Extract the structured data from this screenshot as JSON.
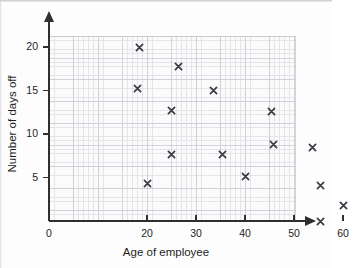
{
  "chart_data": {
    "type": "scatter",
    "title": "",
    "xlabel": "Age of employee",
    "ylabel": "Number of days off",
    "xlim": [
      0,
      63
    ],
    "ylim": [
      0,
      21.5
    ],
    "xticks": [
      0,
      20,
      30,
      40,
      50,
      60
    ],
    "xtick_labels": [
      "0",
      "20",
      "30",
      "40",
      "50",
      "60"
    ],
    "yticks": [
      5,
      10,
      15,
      20
    ],
    "ytick_labels": [
      "5",
      "10",
      "15",
      "20"
    ],
    "grid": true,
    "grid_minor": true,
    "legend": "none",
    "marker": "x",
    "marker_color": "#3a3a44",
    "series": [
      {
        "name": "Employees",
        "points": [
          {
            "age": 18.5,
            "days_off": 20.0
          },
          {
            "age": 18.0,
            "days_off": 15.2
          },
          {
            "age": 20.0,
            "days_off": 4.3
          },
          {
            "age": 25.0,
            "days_off": 12.7
          },
          {
            "age": 25.0,
            "days_off": 7.7
          },
          {
            "age": 26.5,
            "days_off": 17.8
          },
          {
            "age": 33.5,
            "days_off": 15.0
          },
          {
            "age": 35.5,
            "days_off": 7.7
          },
          {
            "age": 40.0,
            "days_off": 5.1
          },
          {
            "age": 45.5,
            "days_off": 12.6
          },
          {
            "age": 45.8,
            "days_off": 8.8
          },
          {
            "age": 53.8,
            "days_off": 8.4
          },
          {
            "age": 55.5,
            "days_off": 4.1
          },
          {
            "age": 55.5,
            "days_off": 0.0
          },
          {
            "age": 60.0,
            "days_off": 1.8
          }
        ]
      }
    ]
  },
  "colors": {
    "marker": "#3a3a44",
    "axis": "#2f2f2f",
    "grid_minor": "#e3e0e6",
    "grid_major": "#cfcbd4",
    "plot_background": "#fcfbfc",
    "figure_background": "#fdfdfd",
    "text": "#1d1d1d"
  }
}
